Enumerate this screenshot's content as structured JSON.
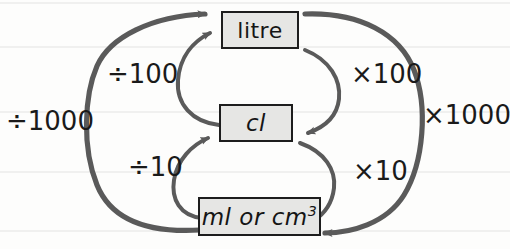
{
  "diagram": {
    "ink_color": "#4a4a4a",
    "box_fill": "#e6e6e4",
    "box_border": "#1d1d1d",
    "text_color": "#151515",
    "rule_color": "#e2e2e0",
    "boxes": [
      {
        "id": "litre",
        "label": "litre"
      },
      {
        "id": "cl",
        "label": "cl"
      },
      {
        "id": "ml",
        "label_prefix": "ml or cm",
        "label_exponent": "3"
      }
    ],
    "operations": [
      {
        "id": "div1000",
        "label": "÷1000",
        "from": "ml",
        "to": "litre",
        "side": "left"
      },
      {
        "id": "div100",
        "label": "÷100",
        "from": "cl",
        "to": "litre",
        "side": "left"
      },
      {
        "id": "div10",
        "label": "÷10",
        "from": "ml",
        "to": "cl",
        "side": "left"
      },
      {
        "id": "mul100",
        "label": "×100",
        "from": "litre",
        "to": "cl",
        "side": "right"
      },
      {
        "id": "mul10",
        "label": "×10",
        "from": "cl",
        "to": "ml",
        "side": "right"
      },
      {
        "id": "mul1000",
        "label": "×1000",
        "from": "litre",
        "to": "ml",
        "side": "right"
      }
    ],
    "ruled_line_positions": [
      3,
      47,
      112,
      172,
      231
    ]
  }
}
